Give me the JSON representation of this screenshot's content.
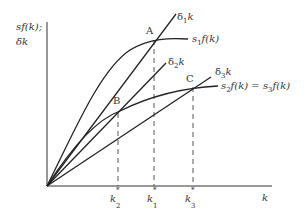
{
  "diagram": {
    "y_axis_label_line1": "sf(k);",
    "y_axis_label_line2": "δk",
    "x_axis_label": "k",
    "curves": [
      {
        "id": "delta1k",
        "label_main": "δ",
        "label_sub": "1",
        "label_tail": "k",
        "type": "line"
      },
      {
        "id": "s1fk",
        "label_main": "s",
        "label_sub": "1",
        "label_tail": "f(k)",
        "type": "concave"
      },
      {
        "id": "delta2k",
        "label_main": "δ",
        "label_sub": "2",
        "label_tail": "k",
        "type": "line"
      },
      {
        "id": "delta3k",
        "label_main": "δ",
        "label_sub": "3",
        "label_tail": "k",
        "type": "line"
      },
      {
        "id": "s2fk",
        "label_main": "s",
        "label_sub": "2",
        "label_tail": "f(k) = ",
        "label_main2": "s",
        "label_sub2": "3",
        "label_tail2": "f(k)",
        "type": "concave"
      }
    ],
    "points": {
      "A": "A",
      "B": "B",
      "C": "C"
    },
    "x_ticks": [
      {
        "main": "k",
        "sup": "*",
        "sub": "2"
      },
      {
        "main": "k",
        "sup": "*",
        "sub": "1"
      },
      {
        "main": "k",
        "sup": "*",
        "sub": "3"
      }
    ],
    "line_color": "#222222"
  }
}
